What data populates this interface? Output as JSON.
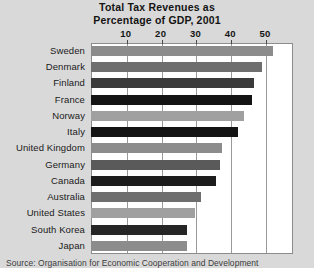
{
  "chart_data": {
    "type": "bar",
    "orientation": "horizontal",
    "title": "Total Tax Revenues as Percentage of GDP, 2001",
    "title_lines": [
      "Total Tax Revenues as",
      "Percentage of GDP, 2001"
    ],
    "xlabel": "",
    "ylabel": "",
    "xlim": [
      0,
      58
    ],
    "xticks": [
      10,
      20,
      30,
      40,
      50
    ],
    "xticklabels": [
      "10",
      "20",
      "30",
      "40",
      "50"
    ],
    "grid": "vertical",
    "legend": "none",
    "categories": [
      "Sweden",
      "Denmark",
      "Finland",
      "France",
      "Norway",
      "Italy",
      "United Kingdom",
      "Germany",
      "Canada",
      "Australia",
      "United States",
      "South Korea",
      "Japan"
    ],
    "values": [
      52.3,
      49.0,
      46.9,
      46.1,
      44.0,
      42.3,
      37.6,
      37.1,
      35.8,
      31.7,
      30.0,
      27.5,
      27.5
    ],
    "bar_colors": [
      "#8c8c8c",
      "#6e6e6e",
      "#3a3a3a",
      "#141414",
      "#a0a0a0",
      "#141414",
      "#8c8c8c",
      "#5a5a5a",
      "#1c1c1c",
      "#6e6e6e",
      "#a0a0a0",
      "#262626",
      "#8c8c8c",
      "#5a5a5a"
    ],
    "source": "Source: Organisation for Economic Cooperation and Development"
  },
  "figure": {
    "page_background": "#d9d9d9",
    "plot_background": "#ffffff",
    "grid_color": "#9a9a9a",
    "frame_color": "#8c8c8c",
    "text_color": "#141414"
  }
}
